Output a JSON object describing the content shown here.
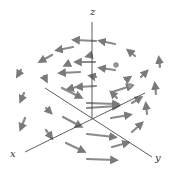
{
  "figure": {
    "type": "3d-vector-field",
    "background": "#ffffff",
    "axis_color": "#333333",
    "arrow_color": "#8a8a8a",
    "arrow_head_color": "#7a7a7a"
  },
  "axes": {
    "z": {
      "label": "z",
      "x1": 92,
      "y1": 118,
      "x2": 92,
      "y2": 22,
      "label_x": 90,
      "label_y": 15
    },
    "x": {
      "label": "x",
      "x1": 145,
      "y1": 93,
      "x2": 25,
      "y2": 152,
      "label_x": 10,
      "label_y": 157
    },
    "y": {
      "label": "y",
      "x1": 45,
      "y1": 88,
      "x2": 152,
      "y2": 157,
      "label_x": 155,
      "label_y": 161
    }
  },
  "arrows": [
    {
      "x1": 96,
      "y1": 41,
      "x2": 75,
      "y2": 40
    },
    {
      "x1": 115,
      "y1": 44,
      "x2": 101,
      "y2": 41
    },
    {
      "x1": 73,
      "y1": 47,
      "x2": 58,
      "y2": 50
    },
    {
      "x1": 52,
      "y1": 55,
      "x2": 41,
      "y2": 61
    },
    {
      "x1": 92,
      "y1": 55,
      "x2": 88,
      "y2": 56
    },
    {
      "x1": 135,
      "y1": 56,
      "x2": 129,
      "y2": 51
    },
    {
      "x1": 160,
      "y1": 67,
      "x2": 159,
      "y2": 59
    },
    {
      "x1": 95,
      "y1": 62,
      "x2": 77,
      "y2": 62
    },
    {
      "x1": 68,
      "y1": 64,
      "x2": 66,
      "y2": 65
    },
    {
      "x1": 21,
      "y1": 70,
      "x2": 18,
      "y2": 75
    },
    {
      "x1": 115,
      "y1": 70,
      "x2": 101,
      "y2": 68
    },
    {
      "x1": 116,
      "y1": 65,
      "x2": 116,
      "y2": 65
    },
    {
      "x1": 80,
      "y1": 72,
      "x2": 61,
      "y2": 73
    },
    {
      "x1": 141,
      "y1": 77,
      "x2": 146,
      "y2": 72
    },
    {
      "x1": 96,
      "y1": 77,
      "x2": 91,
      "y2": 76
    },
    {
      "x1": 44,
      "y1": 76,
      "x2": 46,
      "y2": 80
    },
    {
      "x1": 126,
      "y1": 80,
      "x2": 129,
      "y2": 78
    },
    {
      "x1": 96,
      "y1": 86,
      "x2": 78,
      "y2": 87
    },
    {
      "x1": 76,
      "y1": 87,
      "x2": 69,
      "y2": 89
    },
    {
      "x1": 156,
      "y1": 94,
      "x2": 155,
      "y2": 85
    },
    {
      "x1": 62,
      "y1": 88,
      "x2": 80,
      "y2": 97
    },
    {
      "x1": 112,
      "y1": 92,
      "x2": 131,
      "y2": 86
    },
    {
      "x1": 130,
      "y1": 86,
      "x2": 131,
      "y2": 86
    },
    {
      "x1": 117,
      "y1": 98,
      "x2": 112,
      "y2": 93
    },
    {
      "x1": 24,
      "y1": 93,
      "x2": 21,
      "y2": 100
    },
    {
      "x1": 87,
      "y1": 103,
      "x2": 117,
      "y2": 104
    },
    {
      "x1": 46,
      "y1": 108,
      "x2": 50,
      "y2": 112
    },
    {
      "x1": 87,
      "y1": 108,
      "x2": 117,
      "y2": 106
    },
    {
      "x1": 132,
      "y1": 103,
      "x2": 140,
      "y2": 98
    },
    {
      "x1": 147,
      "y1": 114,
      "x2": 146,
      "y2": 105
    },
    {
      "x1": 111,
      "y1": 118,
      "x2": 129,
      "y2": 115
    },
    {
      "x1": 63,
      "y1": 117,
      "x2": 80,
      "y2": 126
    },
    {
      "x1": 25,
      "y1": 118,
      "x2": 21,
      "y2": 128
    },
    {
      "x1": 132,
      "y1": 132,
      "x2": 141,
      "y2": 124
    },
    {
      "x1": 46,
      "y1": 130,
      "x2": 51,
      "y2": 137
    },
    {
      "x1": 87,
      "y1": 134,
      "x2": 114,
      "y2": 137
    },
    {
      "x1": 112,
      "y1": 147,
      "x2": 127,
      "y2": 143
    },
    {
      "x1": 66,
      "y1": 143,
      "x2": 83,
      "y2": 151
    },
    {
      "x1": 87,
      "y1": 159,
      "x2": 115,
      "y2": 160
    }
  ]
}
